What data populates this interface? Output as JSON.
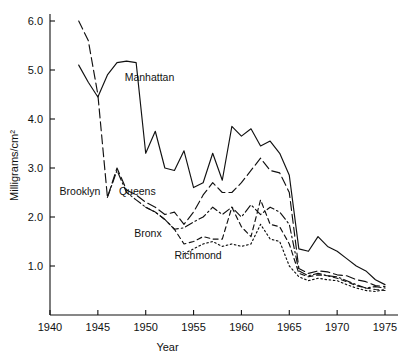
{
  "chart_data": {
    "type": "line",
    "title": "",
    "xlabel": "Year",
    "ylabel": "Milligrams/cm²",
    "xlim": [
      1940,
      1976
    ],
    "ylim": [
      0,
      6.4
    ],
    "grid": false,
    "legend": "inline-labels",
    "xticks": [
      1940,
      1945,
      1950,
      1955,
      1960,
      1965,
      1970,
      1975
    ],
    "xtick_labels": [
      "1940",
      "1945",
      "1950",
      "1955",
      "1960",
      "1965",
      "1970",
      "1975"
    ],
    "yticks": [
      1.0,
      2.0,
      3.0,
      4.0,
      5.0,
      6.0
    ],
    "ytick_labels": [
      "1.0",
      "2.0",
      "3.0",
      "4.0",
      "5.0",
      "6.0"
    ],
    "series": [
      {
        "name": "Manhattan",
        "line_style": "solid",
        "label_x": 1947.8,
        "label_y": 4.78,
        "x": [
          1943,
          1944,
          1945,
          1946,
          1947,
          1948,
          1949,
          1950,
          1951,
          1952,
          1953,
          1954,
          1955,
          1956,
          1957,
          1958,
          1959,
          1960,
          1961,
          1962,
          1963,
          1964,
          1965,
          1966,
          1967,
          1968,
          1969,
          1970,
          1971,
          1972,
          1973,
          1974,
          1975
        ],
        "y": [
          5.1,
          4.75,
          4.45,
          4.9,
          5.15,
          5.18,
          5.15,
          3.3,
          3.75,
          3.0,
          2.95,
          3.35,
          2.6,
          2.7,
          3.3,
          2.75,
          3.85,
          3.65,
          3.8,
          3.45,
          3.55,
          3.3,
          2.85,
          1.35,
          1.3,
          1.6,
          1.4,
          1.3,
          1.15,
          1.0,
          0.9,
          0.72,
          0.62
        ]
      },
      {
        "name": "Brooklyn",
        "line_style": "long-dash",
        "label_x": 1941.0,
        "label_y": 2.45,
        "x": [
          1943,
          1944,
          1945,
          1946,
          1947,
          1948,
          1949,
          1950,
          1951,
          1952,
          1953,
          1954,
          1955,
          1956,
          1957,
          1958,
          1959,
          1960,
          1961,
          1962,
          1963,
          1964,
          1965,
          1966,
          1967,
          1968,
          1969,
          1970,
          1971,
          1972,
          1973,
          1974,
          1975
        ],
        "y": [
          6.0,
          5.6,
          4.5,
          2.4,
          3.0,
          2.55,
          2.45,
          2.3,
          2.2,
          2.05,
          2.1,
          1.85,
          2.1,
          2.45,
          2.7,
          2.5,
          2.5,
          2.7,
          2.95,
          3.2,
          2.95,
          2.9,
          2.5,
          0.95,
          0.85,
          0.9,
          0.88,
          0.82,
          0.8,
          0.72,
          0.68,
          0.6,
          0.58
        ]
      },
      {
        "name": "Queens",
        "line_style": "dash-dot",
        "label_x": 1947.2,
        "label_y": 2.45,
        "x": [
          1946,
          1947,
          1948,
          1949,
          1950,
          1951,
          1952,
          1953,
          1954,
          1955,
          1956,
          1957,
          1958,
          1959,
          1960,
          1961,
          1962,
          1963,
          1964,
          1965,
          1966,
          1967,
          1968,
          1969,
          1970,
          1971,
          1972,
          1973,
          1974,
          1975
        ],
        "y": [
          2.4,
          2.95,
          2.5,
          2.35,
          2.2,
          2.1,
          1.95,
          1.75,
          1.78,
          1.9,
          2.0,
          2.2,
          2.05,
          2.2,
          2.0,
          2.25,
          2.05,
          2.2,
          2.1,
          1.85,
          0.9,
          0.8,
          0.85,
          0.8,
          0.78,
          0.7,
          0.62,
          0.55,
          0.58,
          0.55
        ]
      },
      {
        "name": "Bronx",
        "line_style": "dash",
        "label_x": 1948.8,
        "label_y": 1.6,
        "x": [
          1950,
          1951,
          1952,
          1953,
          1954,
          1955,
          1956,
          1957,
          1958,
          1959,
          1960,
          1961,
          1962,
          1963,
          1964,
          1965,
          1966,
          1967,
          1968,
          1969,
          1970,
          1971,
          1972,
          1973,
          1974,
          1975
        ],
        "y": [
          2.2,
          2.1,
          1.95,
          1.75,
          1.45,
          1.5,
          1.6,
          1.55,
          1.55,
          2.2,
          1.8,
          1.6,
          2.35,
          1.85,
          1.8,
          1.45,
          0.85,
          0.78,
          0.82,
          0.8,
          0.75,
          0.68,
          0.6,
          0.55,
          0.52,
          0.5
        ]
      },
      {
        "name": "Richmond",
        "line_style": "dot",
        "label_x": 1953.0,
        "label_y": 1.15,
        "x": [
          1954,
          1955,
          1956,
          1957,
          1958,
          1959,
          1960,
          1961,
          1962,
          1963,
          1964,
          1965,
          1966,
          1967,
          1968,
          1969,
          1970,
          1971,
          1972,
          1973,
          1974,
          1975
        ],
        "y": [
          1.25,
          1.35,
          1.45,
          1.5,
          1.4,
          1.45,
          1.4,
          1.45,
          1.85,
          1.55,
          1.5,
          1.0,
          0.78,
          0.7,
          0.75,
          0.72,
          0.7,
          0.62,
          0.55,
          0.5,
          0.48,
          0.52
        ]
      }
    ]
  }
}
